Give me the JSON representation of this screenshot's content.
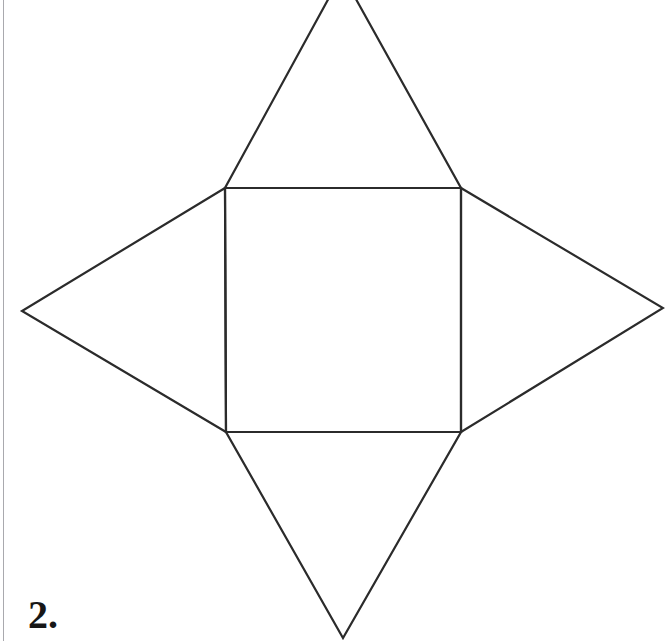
{
  "page": {
    "width": 665,
    "height": 641,
    "background_color": "#ffffff",
    "margin_rule_color": "#a9a9ae"
  },
  "problem": {
    "number_label": "2."
  },
  "figure": {
    "name": "square-pyramid-net",
    "stroke_color": "#2b2b2b",
    "fill_color": "none",
    "stroke_width": 2.2,
    "square": {
      "name": "central-square",
      "corners": {
        "top_left": [
          225,
          188
        ],
        "top_right": [
          461,
          188
        ],
        "bottom_right": [
          461,
          432
        ],
        "bottom_left": [
          226,
          432
        ]
      }
    },
    "triangles": [
      {
        "name": "top-triangle",
        "apex": [
          342,
          -26
        ],
        "base": [
          [
            225,
            188
          ],
          [
            461,
            188
          ]
        ],
        "clipped_at_top_edge": true
      },
      {
        "name": "right-triangle",
        "apex": [
          663,
          308
        ],
        "base": [
          [
            461,
            188
          ],
          [
            461,
            432
          ]
        ],
        "clipped_at_top_edge": false
      },
      {
        "name": "bottom-triangle",
        "apex": [
          343,
          638
        ],
        "base": [
          [
            226,
            432
          ],
          [
            461,
            432
          ]
        ],
        "clipped_at_top_edge": false
      },
      {
        "name": "left-triangle",
        "apex": [
          22,
          311
        ],
        "base": [
          [
            225,
            188
          ],
          [
            226,
            432
          ]
        ],
        "clipped_at_top_edge": false
      }
    ]
  }
}
